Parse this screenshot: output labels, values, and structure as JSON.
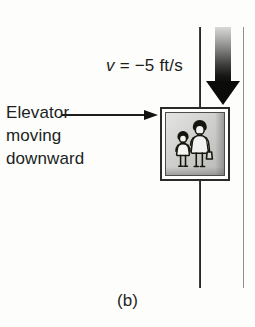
{
  "figure": {
    "caption": "(b)",
    "background_color": "#fdfdfc"
  },
  "velocity_annotation": {
    "symbol": "v",
    "equals": " = ",
    "value": "−5 ft/s",
    "full_text": "v = −5 ft/s"
  },
  "elevator_annotation": {
    "lines": [
      "Elevator",
      "moving",
      "downward"
    ],
    "line1": "Elevator",
    "line2": "moving",
    "line3": "downward"
  },
  "elevator": {
    "occupant_count": 2,
    "occupants": [
      "child-figure",
      "adult-figure"
    ],
    "frame_color": "#2a2a28",
    "interior_color": "#cfcfcd"
  },
  "motion_arrow": {
    "direction": "down",
    "icon": "down-arrow-icon",
    "color": "#0b0b09"
  },
  "shaft": {
    "left_wall_color": "#1d1d1b",
    "right_wall_color": "#8f8f8d"
  }
}
